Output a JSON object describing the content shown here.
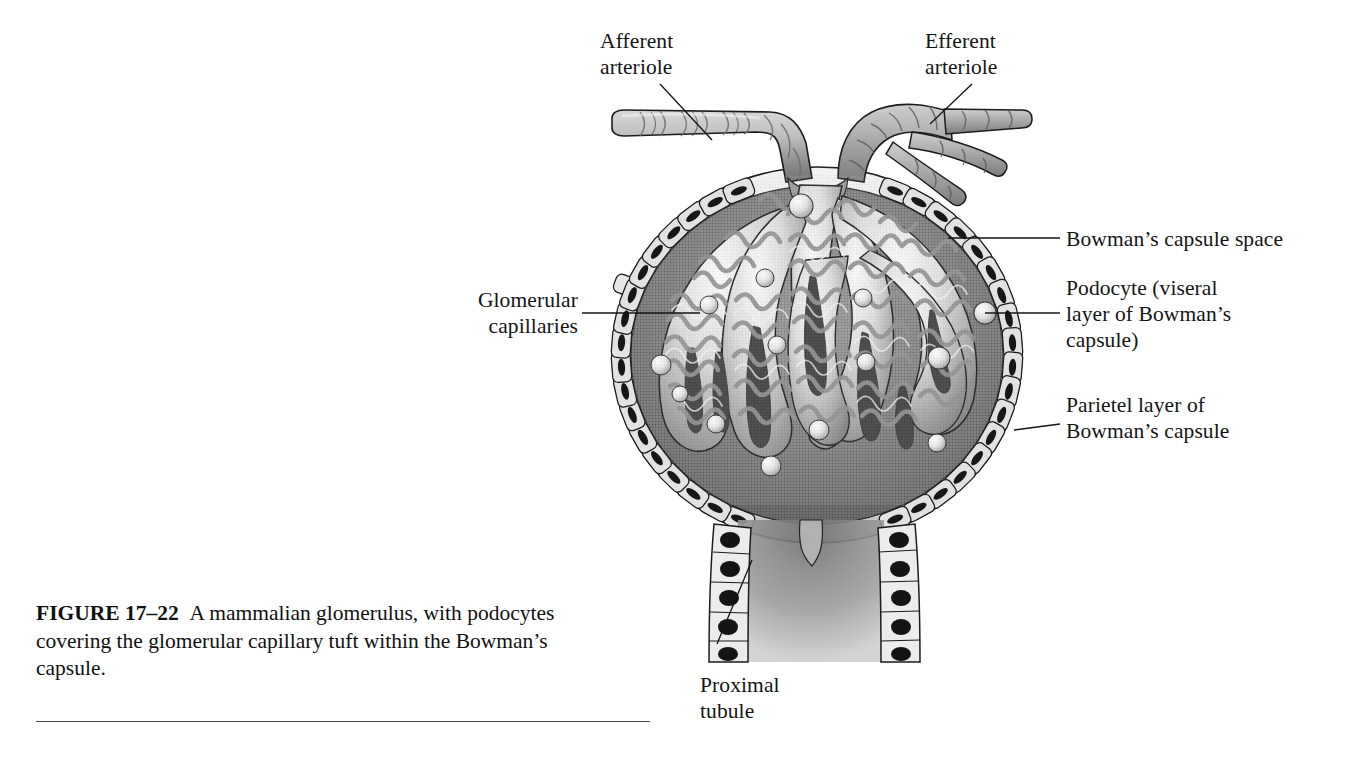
{
  "figure": {
    "number_label": "FIGURE 17–22",
    "caption_text": "A mammalian glomerulus, with podocytes covering the glomerular capillary tuft within the Bowman’s capsule.",
    "type": "anatomical-illustration",
    "rendering": "grayscale halftone line drawing"
  },
  "labels": {
    "afferent_arteriole": "Afferent\narteriole",
    "efferent_arteriole": "Efferent\narteriole",
    "glomerular_capillaries": "Glomerular\ncapillaries",
    "bowmans_capsule_space": "Bowman’s capsule space",
    "podocyte": "Podocyte (viseral\nlayer of Bowman’s\ncapsule)",
    "parietal_layer": "Parietel layer of\nBowman’s capsule",
    "proximal_tubule": "Proximal\ntubule"
  },
  "colors": {
    "page_background": "#ffffff",
    "ink": "#141414",
    "outline": "#1c1c1c",
    "capsule_space_dark": "#5c5c5c",
    "capsule_space_mid": "#747474",
    "epithelium_light": "#e2e2e2",
    "nucleus_dark": "#171717",
    "capillary_light": "#ededed",
    "capillary_mid": "#9a9a9a",
    "capillary_shadow": "#5a5a5a",
    "arteriole_fill": "#b8b8b8",
    "podocyte_body": "#f0f0f0",
    "rule": "#4a4a4a"
  },
  "geometry": {
    "capsule_center_x": 817,
    "capsule_center_y": 355,
    "capsule_radius_x": 205,
    "capsule_radius_y": 188,
    "vascular_pole_y": 175,
    "urinary_pole_y": 540,
    "tubule_bottom_y": 662
  }
}
